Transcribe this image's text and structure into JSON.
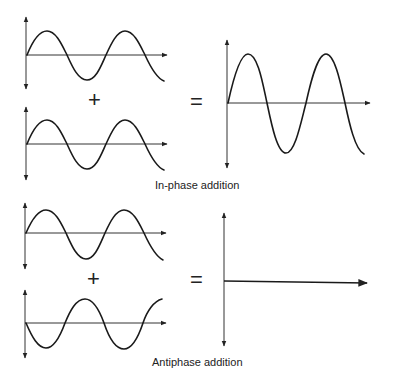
{
  "diagram": {
    "sections": [
      {
        "id": "in-phase",
        "label": "In-phase addition",
        "operator_plus": "+",
        "operator_equals": "=",
        "inputs": [
          "sine wave",
          "sine wave (same phase)"
        ],
        "result": "sine wave with double amplitude"
      },
      {
        "id": "antiphase",
        "label": "Antiphase addition",
        "operator_plus": "+",
        "operator_equals": "=",
        "inputs": [
          "sine wave",
          "inverted sine wave (180° out of phase)"
        ],
        "result": "flat line (zero amplitude)"
      }
    ],
    "colors": {
      "stroke": "#1a1a1a",
      "background": "#ffffff"
    }
  }
}
